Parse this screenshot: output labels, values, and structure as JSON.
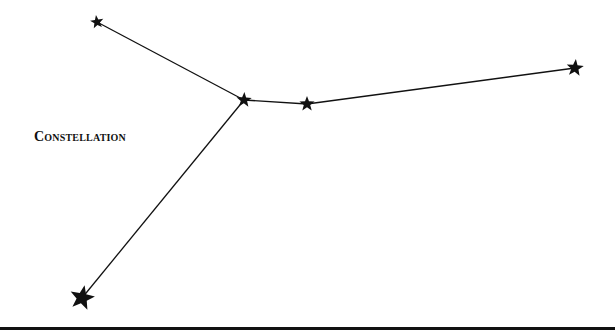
{
  "title": "Constellation",
  "colors": {
    "ink": "#111111",
    "background": "#ffffff"
  },
  "stars": [
    {
      "id": "star-top-left",
      "x": 97,
      "y": 22,
      "size": 7
    },
    {
      "id": "star-center-left",
      "x": 244,
      "y": 100,
      "size": 8
    },
    {
      "id": "star-center-right",
      "x": 307,
      "y": 104,
      "size": 8
    },
    {
      "id": "star-far-right",
      "x": 575,
      "y": 68,
      "size": 9
    },
    {
      "id": "star-bottom-left",
      "x": 82,
      "y": 298,
      "size": 13
    }
  ],
  "lines": [
    {
      "from": 0,
      "to": 1
    },
    {
      "from": 1,
      "to": 2
    },
    {
      "from": 2,
      "to": 3
    },
    {
      "from": 1,
      "to": 4
    }
  ]
}
